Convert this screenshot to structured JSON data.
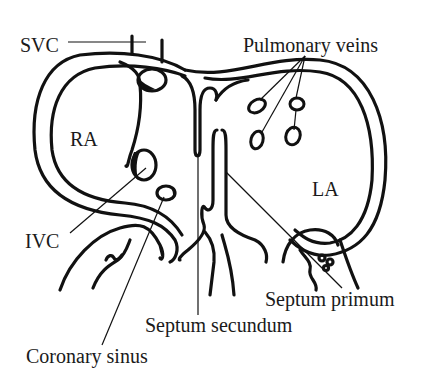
{
  "figure": {
    "type": "anatomical-diagram"
  },
  "labels": {
    "svc": "SVC",
    "pulmonary_veins": "Pulmonary veins",
    "ra": "RA",
    "la": "LA",
    "ivc": "IVC",
    "septum_primum": "Septum primum",
    "septum_secundum": "Septum secundum",
    "coronary_sinus": "Coronary sinus"
  },
  "colors": {
    "ink": "#111111",
    "background": "#ffffff"
  }
}
